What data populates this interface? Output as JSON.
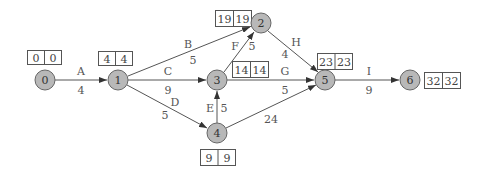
{
  "diagram": {
    "type": "activity-on-arrow network (critical path)",
    "colors": {
      "node_fill": "#b8b8b8",
      "node_stroke": "#666666",
      "edge": "#555555",
      "box_stroke": "#555555",
      "text": "#444444"
    },
    "nodes": [
      {
        "id": "0",
        "label": "0",
        "cx": 45,
        "cy": 80,
        "times": [
          "0",
          "0"
        ],
        "box": {
          "x": 27,
          "y": 50,
          "w": 34,
          "h": 14
        }
      },
      {
        "id": "1",
        "label": "1",
        "cx": 118,
        "cy": 80,
        "times": [
          "4",
          "4"
        ],
        "box": {
          "x": 98,
          "y": 51,
          "w": 34,
          "h": 14
        }
      },
      {
        "id": "2",
        "label": "2",
        "cx": 261,
        "cy": 23,
        "times": [
          "19",
          "19"
        ],
        "box": {
          "x": 215,
          "y": 10,
          "w": 36,
          "h": 16
        }
      },
      {
        "id": "3",
        "label": "3",
        "cx": 217,
        "cy": 80,
        "times": [
          "14",
          "14"
        ],
        "box": {
          "x": 232,
          "y": 61,
          "w": 36,
          "h": 16
        }
      },
      {
        "id": "4",
        "label": "4",
        "cx": 217,
        "cy": 133,
        "times": [
          "9",
          "9"
        ],
        "box": {
          "x": 200,
          "y": 149,
          "w": 35,
          "h": 16
        }
      },
      {
        "id": "5",
        "label": "5",
        "cx": 325,
        "cy": 80,
        "times": [
          "23",
          "23"
        ],
        "box": {
          "x": 317,
          "y": 53,
          "w": 35,
          "h": 16
        }
      },
      {
        "id": "6",
        "label": "6",
        "cx": 410,
        "cy": 80,
        "times": [
          "32",
          "32"
        ],
        "box": {
          "x": 424,
          "y": 72,
          "w": 36,
          "h": 16
        }
      }
    ],
    "edges": [
      {
        "activity": "A",
        "duration": "4",
        "from": "0",
        "to": "1"
      },
      {
        "activity": "B",
        "duration": "5",
        "from": "1",
        "to": "2"
      },
      {
        "activity": "C",
        "duration": "9",
        "from": "1",
        "to": "3"
      },
      {
        "activity": "D",
        "duration": "5",
        "from": "1",
        "to": "4"
      },
      {
        "activity": "E",
        "duration": "5",
        "from": "4",
        "to": "3"
      },
      {
        "activity": "F",
        "duration": "5",
        "from": "3",
        "to": "2"
      },
      {
        "activity": "G",
        "duration": "5",
        "from": "3",
        "to": "5"
      },
      {
        "activity": "H",
        "duration": "4",
        "from": "2",
        "to": "5"
      },
      {
        "activity": "",
        "duration": "24",
        "from": "4",
        "to": "5"
      },
      {
        "activity": "I",
        "duration": "9",
        "from": "5",
        "to": "6"
      }
    ]
  }
}
